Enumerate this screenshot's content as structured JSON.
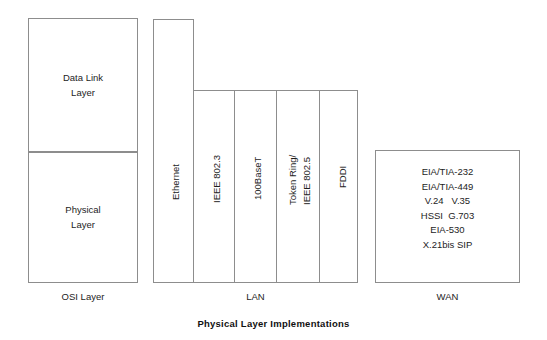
{
  "figure": {
    "caption": "Physical Layer Implementations"
  },
  "osi_column": {
    "group_label": "OSI Layer",
    "layers": [
      {
        "name": "data-link-layer",
        "label": "Data Link\nLayer"
      },
      {
        "name": "physical-layer",
        "label": "Physical\nLayer"
      }
    ]
  },
  "lan_column": {
    "group_label": "LAN",
    "technologies": [
      {
        "name": "ethernet",
        "lines": [
          "Ethernet"
        ]
      },
      {
        "name": "ieee-802-3",
        "lines": [
          "IEEE 802.3"
        ]
      },
      {
        "name": "100baset",
        "lines": [
          "100BaseT"
        ]
      },
      {
        "name": "token-ring-ieee-802-5",
        "lines": [
          "Token Ring/",
          "IEEE 802.5"
        ]
      },
      {
        "name": "fddi",
        "lines": [
          "FDDI"
        ]
      }
    ]
  },
  "wan_column": {
    "group_label": "WAN",
    "protocol_rows": [
      "EIA/TIA-232",
      "EIA/TIA-449",
      "V.24   V.35",
      "HSSI  G.703",
      "EIA-530",
      "X.21bis SIP"
    ]
  },
  "colors": {
    "background": "#ffffff",
    "stroke": "#8d8d8d",
    "text": "#1d1d1d",
    "caption_text": "#111111"
  }
}
